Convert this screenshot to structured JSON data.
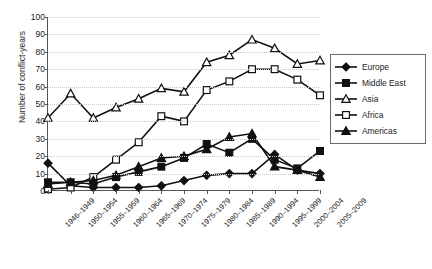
{
  "chart_data": {
    "type": "line",
    "title": "",
    "xlabel": "",
    "ylabel": "Number of conflict-years",
    "ylim": [
      0,
      100
    ],
    "ytick_step": 10,
    "grid": true,
    "legend_position": "right",
    "categories": [
      "1946–1949",
      "1950–1954",
      "1955–1959",
      "1960–1964",
      "1965–1969",
      "1970–1974",
      "1975–1979",
      "1980–1984",
      "1985–1989",
      "1990–1994",
      "1995–1999",
      "2000–2004",
      "2005–2009"
    ],
    "yticks": [
      0,
      10,
      20,
      30,
      40,
      50,
      60,
      70,
      80,
      90,
      100
    ],
    "series": [
      {
        "name": "Europe",
        "marker": "filled-diamond",
        "color": "#111111",
        "values": [
          16,
          3,
          2,
          2,
          2,
          3,
          6,
          9,
          10,
          10,
          21,
          12,
          10
        ]
      },
      {
        "name": "Middle East",
        "marker": "filled-square",
        "color": "#111111",
        "values": [
          5,
          5,
          4,
          8,
          11,
          14,
          19,
          27,
          22,
          30,
          18,
          13,
          23
        ]
      },
      {
        "name": "Asia",
        "marker": "open-triangle",
        "color": "#111111",
        "values": [
          42,
          56,
          42,
          48,
          53,
          59,
          57,
          74,
          78,
          87,
          82,
          73,
          75
        ]
      },
      {
        "name": "Africa",
        "marker": "open-square",
        "color": "#111111",
        "values": [
          1,
          2,
          8,
          18,
          28,
          43,
          40,
          58,
          63,
          70,
          70,
          64,
          55
        ]
      },
      {
        "name": "Americas",
        "marker": "filled-triangle",
        "color": "#111111",
        "values": [
          4,
          5,
          6,
          9,
          14,
          19,
          20,
          24,
          31,
          33,
          14,
          12,
          8
        ]
      }
    ]
  },
  "legend": {
    "items": [
      {
        "label": "Europe"
      },
      {
        "label": "Middle East"
      },
      {
        "label": "Asia"
      },
      {
        "label": "Africa"
      },
      {
        "label": "Americas"
      }
    ]
  },
  "caption": {
    "text": ""
  }
}
